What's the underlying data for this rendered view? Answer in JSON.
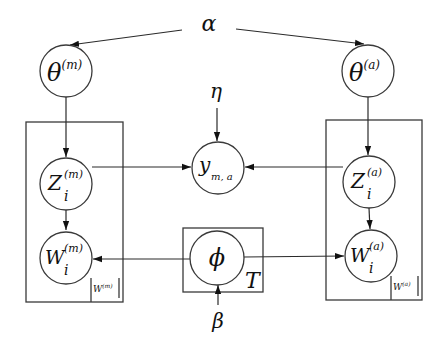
{
  "diagram": {
    "type": "plate-notation-graphical-model",
    "hyperparameters": {
      "alpha": "α",
      "eta": "η",
      "beta": "β"
    },
    "nodes": {
      "theta_m": {
        "symbol": "θ",
        "sup": "(m)",
        "sub": ""
      },
      "theta_a": {
        "symbol": "θ",
        "sup": "(a)",
        "sub": ""
      },
      "z_m": {
        "symbol": "Z",
        "sup": "(m)",
        "sub": "i"
      },
      "z_a": {
        "symbol": "Z",
        "sup": "(a)",
        "sub": "i"
      },
      "w_m": {
        "symbol": "W",
        "sup": "(m)",
        "sub": "i"
      },
      "w_a": {
        "symbol": "W",
        "sup": "(a)",
        "sub": "i"
      },
      "y": {
        "symbol": "y",
        "sup": "",
        "sub": "m, a"
      },
      "phi": {
        "symbol": "ϕ",
        "sup": "",
        "sub": ""
      }
    },
    "plates": {
      "left": {
        "label_symbol": "W",
        "label_sup": "(m)"
      },
      "right": {
        "label_symbol": "W",
        "label_sup": "(a)"
      },
      "topic": {
        "label": "T"
      }
    },
    "edges": [
      {
        "from": "alpha",
        "to": "theta_m"
      },
      {
        "from": "alpha",
        "to": "theta_a"
      },
      {
        "from": "theta_m",
        "to": "z_m"
      },
      {
        "from": "theta_a",
        "to": "z_a"
      },
      {
        "from": "z_m",
        "to": "w_m"
      },
      {
        "from": "z_a",
        "to": "w_a"
      },
      {
        "from": "z_m",
        "to": "y"
      },
      {
        "from": "z_a",
        "to": "y"
      },
      {
        "from": "eta",
        "to": "y"
      },
      {
        "from": "phi",
        "to": "w_m"
      },
      {
        "from": "phi",
        "to": "w_a"
      },
      {
        "from": "beta",
        "to": "phi"
      }
    ]
  }
}
